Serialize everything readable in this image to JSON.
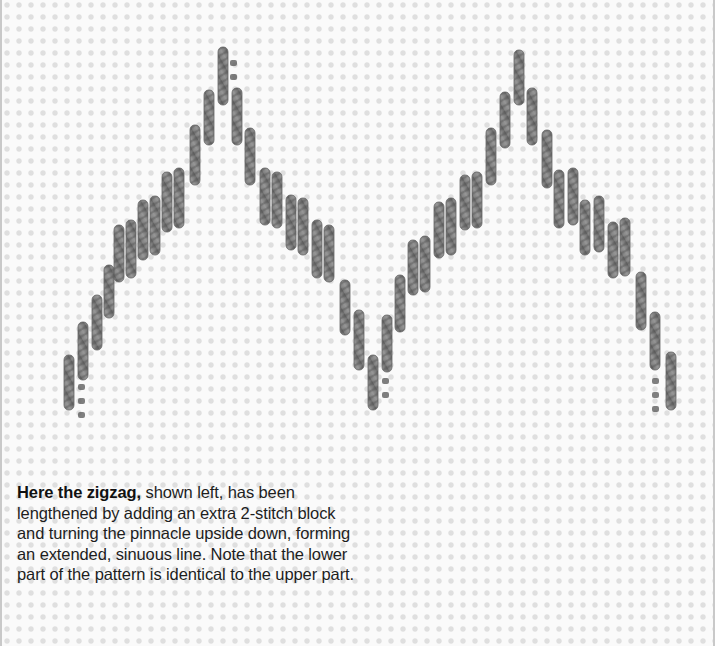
{
  "caption": {
    "lead": "Here the zigzag,",
    "body": " shown left, has been lengthened by adding an extra 2-stitch block and turning the pinnacle upside down, forming an extended, sinuous line. Note that the lower part of the pattern is identical to the upper part."
  },
  "colors": {
    "canvas": "#fafafa",
    "canvas_hole": "#c8c8c8",
    "stitch_dark": "#555555",
    "stitch_light": "#8a8a8a",
    "border": "#c9c9c9"
  },
  "illustration": {
    "subject": "zigzag-embroidery-stitch-on-canvas",
    "stitch_width": 10,
    "stitches": [
      [
        62,
        355,
        410
      ],
      [
        76,
        322,
        380
      ],
      [
        90,
        295,
        350
      ],
      [
        102,
        265,
        318
      ],
      [
        112,
        225,
        282
      ],
      [
        124,
        220,
        278
      ],
      [
        136,
        200,
        260
      ],
      [
        148,
        196,
        255
      ],
      [
        160,
        172,
        232
      ],
      [
        172,
        168,
        228
      ],
      [
        188,
        125,
        185
      ],
      [
        202,
        90,
        145
      ],
      [
        216,
        47,
        105
      ],
      [
        230,
        88,
        145
      ],
      [
        243,
        128,
        185
      ],
      [
        258,
        168,
        225
      ],
      [
        270,
        172,
        228
      ],
      [
        284,
        195,
        250
      ],
      [
        296,
        198,
        255
      ],
      [
        310,
        220,
        278
      ],
      [
        322,
        225,
        282
      ],
      [
        338,
        280,
        335
      ],
      [
        352,
        310,
        370
      ],
      [
        366,
        355,
        410
      ],
      [
        380,
        315,
        372
      ],
      [
        393,
        275,
        332
      ],
      [
        406,
        240,
        295
      ],
      [
        418,
        236,
        292
      ],
      [
        432,
        202,
        258
      ],
      [
        444,
        198,
        255
      ],
      [
        458,
        175,
        230
      ],
      [
        470,
        172,
        228
      ],
      [
        484,
        128,
        185
      ],
      [
        498,
        92,
        148
      ],
      [
        512,
        50,
        105
      ],
      [
        525,
        88,
        145
      ],
      [
        540,
        130,
        188
      ],
      [
        552,
        170,
        228
      ],
      [
        566,
        168,
        225
      ],
      [
        578,
        200,
        255
      ],
      [
        592,
        196,
        252
      ],
      [
        606,
        222,
        278
      ],
      [
        618,
        218,
        276
      ],
      [
        634,
        272,
        330
      ],
      [
        648,
        312,
        370
      ],
      [
        664,
        352,
        410
      ]
    ],
    "hole_marks": [
      [
        228,
        60
      ],
      [
        228,
        74
      ],
      [
        76,
        384
      ],
      [
        76,
        398
      ],
      [
        76,
        412
      ],
      [
        380,
        378
      ],
      [
        380,
        392
      ],
      [
        650,
        378
      ],
      [
        650,
        392
      ],
      [
        650,
        406
      ]
    ]
  }
}
